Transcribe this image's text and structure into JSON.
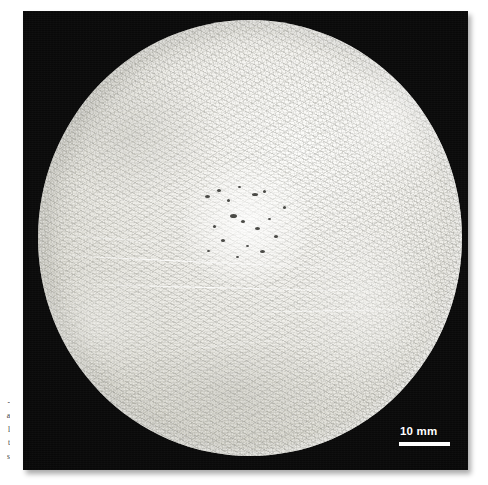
{
  "page": {
    "background_color": "#ffffff",
    "width": 488,
    "height": 485
  },
  "figure": {
    "type": "macrograph-photograph",
    "panel_background_color": "#070707"
  },
  "specimen": {
    "shape": "circle",
    "surface_color": "#efeee9",
    "rim_highlight_color": "#ffffff",
    "features": [
      "dendritic-needle-microstructure",
      "central-porosity-cluster",
      "diagonal-scratches",
      "specular-rim-highlight"
    ]
  },
  "scalebar": {
    "label": "10 mm",
    "value": 10,
    "unit": "mm",
    "color": "#ffffff",
    "bar_length_px": 51
  },
  "caption_strip": {
    "lines": [
      "-",
      "a",
      "l",
      "t",
      "s"
    ]
  }
}
